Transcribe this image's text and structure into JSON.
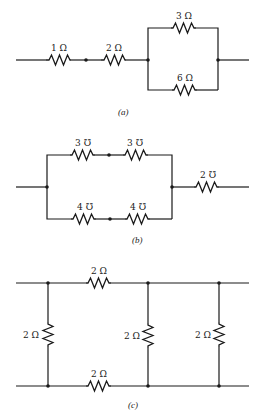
{
  "figure": {
    "colors": {
      "line": "#1a1a1a",
      "text": "#222222",
      "background": "#ffffff"
    }
  },
  "circuit_a": {
    "caption": "(a)",
    "resistors": [
      {
        "id": "r1",
        "label": "1 Ω",
        "value": 1,
        "unit": "ohm"
      },
      {
        "id": "r2",
        "label": "2 Ω",
        "value": 2,
        "unit": "ohm"
      },
      {
        "id": "r3",
        "label": "3 Ω",
        "value": 3,
        "unit": "ohm"
      },
      {
        "id": "r4",
        "label": "6 Ω",
        "value": 6,
        "unit": "ohm"
      }
    ],
    "topology": "1Ω and 2Ω in series, followed by 3Ω parallel with 6Ω"
  },
  "circuit_b": {
    "caption": "(b)",
    "conductances": [
      {
        "id": "g1",
        "label": "3 ℧",
        "value": 3,
        "unit": "mho"
      },
      {
        "id": "g2",
        "label": "3 ℧",
        "value": 3,
        "unit": "mho"
      },
      {
        "id": "g3",
        "label": "4 ℧",
        "value": 4,
        "unit": "mho"
      },
      {
        "id": "g4",
        "label": "4 ℧",
        "value": 4,
        "unit": "mho"
      },
      {
        "id": "g5",
        "label": "2 ℧",
        "value": 2,
        "unit": "mho"
      }
    ],
    "topology": "(3℧ series 3℧) parallel with (4℧ series 4℧), followed by 2℧ in series"
  },
  "circuit_c": {
    "caption": "(c)",
    "resistors": [
      {
        "id": "top",
        "label": "2 Ω",
        "value": 2,
        "unit": "ohm"
      },
      {
        "id": "bottom",
        "label": "2 Ω",
        "value": 2,
        "unit": "ohm"
      },
      {
        "id": "left",
        "label": "2 Ω",
        "value": 2,
        "unit": "ohm"
      },
      {
        "id": "middle",
        "label": "2 Ω",
        "value": 2,
        "unit": "ohm"
      },
      {
        "id": "right",
        "label": "2 Ω",
        "value": 2,
        "unit": "ohm"
      }
    ],
    "topology": "Ladder network: three 2Ω shunt resistors with 2Ω series resistors on top and bottom rails"
  }
}
